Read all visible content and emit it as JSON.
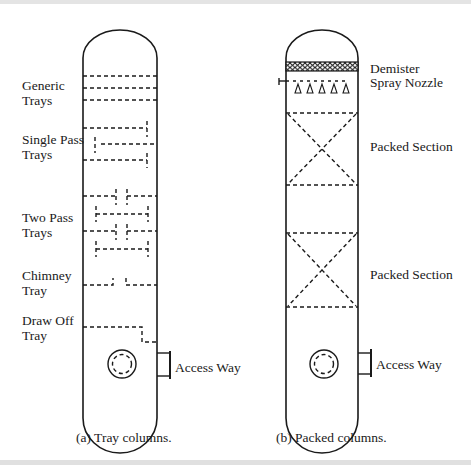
{
  "figure": {
    "panels": [
      {
        "id": "a",
        "caption": "(a) Tray columns.",
        "labels": {
          "generic": [
            "Generic",
            "Trays"
          ],
          "single_pass": [
            "Single Pass",
            "Trays"
          ],
          "two_pass": [
            "Two Pass",
            "Trays"
          ],
          "chimney": [
            "Chimney",
            "Tray"
          ],
          "draw_off": [
            "Draw Off",
            "Tray"
          ],
          "access_way": "Access Way"
        }
      },
      {
        "id": "b",
        "caption": "(b) Packed columns.",
        "labels": {
          "demister": "Demister",
          "spray_nozzle": "Spray Nozzle",
          "packed_section_1": "Packed Section",
          "packed_section_2": "Packed Section",
          "access_way": "Access Way"
        }
      }
    ],
    "colors": {
      "line": "#1a1a1a",
      "background": "#ffffff",
      "border_band": "#e2e2e2"
    }
  }
}
